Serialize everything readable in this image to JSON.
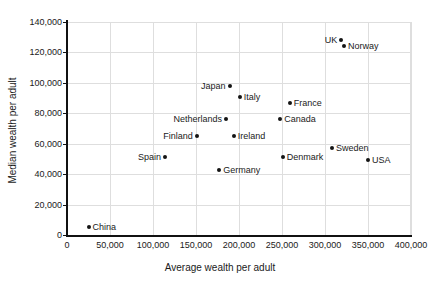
{
  "chart_data": {
    "type": "scatter",
    "title": "",
    "xlabel": "Average wealth per adult",
    "ylabel": "Median wealth per adult",
    "xlim": [
      0,
      400000
    ],
    "ylim": [
      0,
      140000
    ],
    "grid": true,
    "legend": "none",
    "x_ticks": [
      "0",
      "50,000",
      "100,000",
      "150,000",
      "200,000",
      "250,000",
      "300,000",
      "350,000",
      "400,000"
    ],
    "x_tick_values": [
      0,
      50000,
      100000,
      150000,
      200000,
      250000,
      300000,
      350000,
      400000
    ],
    "y_ticks": [
      "0",
      "20,000",
      "40,000",
      "60,000",
      "80,000",
      "100,000",
      "120,000",
      "140,000"
    ],
    "y_tick_values": [
      0,
      20000,
      40000,
      60000,
      80000,
      100000,
      120000,
      140000
    ],
    "points": [
      {
        "label": "China",
        "x": 25000,
        "y": 5000,
        "label_side": "right"
      },
      {
        "label": "Spain",
        "x": 114000,
        "y": 51000,
        "label_side": "left"
      },
      {
        "label": "Finland",
        "x": 151000,
        "y": 65000,
        "label_side": "left"
      },
      {
        "label": "Germany",
        "x": 177000,
        "y": 43000,
        "label_side": "right"
      },
      {
        "label": "Netherlands",
        "x": 185000,
        "y": 76000,
        "label_side": "left"
      },
      {
        "label": "Japan",
        "x": 189000,
        "y": 98000,
        "label_side": "left"
      },
      {
        "label": "Ireland",
        "x": 194000,
        "y": 65000,
        "label_side": "right"
      },
      {
        "label": "Italy",
        "x": 201000,
        "y": 91000,
        "label_side": "right"
      },
      {
        "label": "Canada",
        "x": 248000,
        "y": 76000,
        "label_side": "right"
      },
      {
        "label": "Denmark",
        "x": 251000,
        "y": 51000,
        "label_side": "right"
      },
      {
        "label": "France",
        "x": 259000,
        "y": 87000,
        "label_side": "right"
      },
      {
        "label": "Sweden",
        "x": 308000,
        "y": 57000,
        "label_side": "right"
      },
      {
        "label": "UK",
        "x": 319000,
        "y": 128000,
        "label_side": "left"
      },
      {
        "label": "Norway",
        "x": 322000,
        "y": 124000,
        "label_side": "right"
      },
      {
        "label": "USA",
        "x": 350000,
        "y": 49000,
        "label_side": "right"
      }
    ],
    "colors": {
      "marker": "#141414",
      "axis": "#111111",
      "grid": "#dedede",
      "text": "#1a1a1a",
      "background": "#ffffff"
    }
  }
}
